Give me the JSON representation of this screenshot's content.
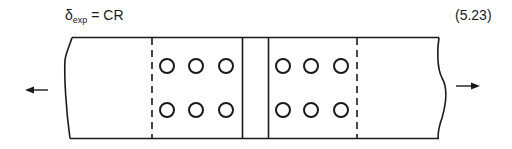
{
  "equation": {
    "symbol": "δ",
    "subscript": "exp",
    "rhs": "= CR",
    "number": "(5.23)"
  },
  "figure": {
    "left_group": {
      "rows": 2,
      "cols": 3
    },
    "right_group": {
      "rows": 2,
      "cols": 3
    },
    "load_arrows": [
      "left",
      "right"
    ],
    "stroke_color": "#1a1a1a"
  }
}
